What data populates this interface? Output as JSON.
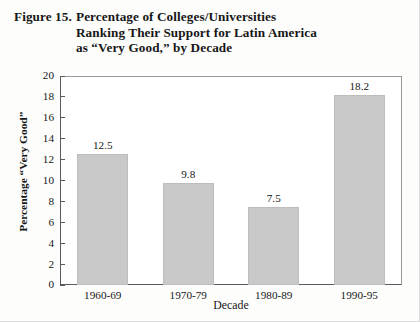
{
  "figure": {
    "label": "Figure 15.",
    "title_lines": [
      "Percentage of Colleges/Universities",
      "Ranking Their Support for Latin America",
      "as “Very Good,” by Decade"
    ]
  },
  "chart_data": {
    "type": "bar",
    "categories": [
      "1960-69",
      "1970-79",
      "1980-89",
      "1990-95"
    ],
    "values": [
      12.5,
      9.8,
      7.5,
      18.2
    ],
    "value_labels": [
      "12.5",
      "9.8",
      "7.5",
      "18.2"
    ],
    "xlabel": "Decade",
    "ylabel": "Percentage “Very Good”",
    "ylim": [
      0,
      20
    ],
    "ytick_step": 2,
    "yticks": [
      "20",
      "18",
      "16",
      "14",
      "12",
      "10",
      "8",
      "6",
      "4",
      "2",
      "0"
    ],
    "ytick_values": [
      20,
      18,
      16,
      14,
      12,
      10,
      8,
      6,
      4,
      2,
      0
    ],
    "grid": false,
    "legend": null,
    "bar_color": "#c9c9c9",
    "axis_color": "#5a5a5a",
    "background": "#ffffff"
  }
}
